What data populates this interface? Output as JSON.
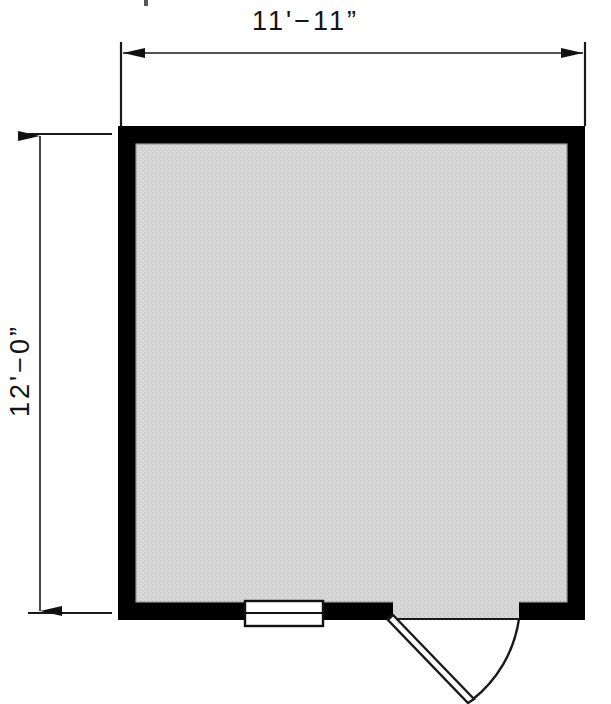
{
  "drawing": {
    "type": "architectural-floor-plan",
    "title": "Shed Floor Plan",
    "units": "feet-inches",
    "background_color": "#ffffff",
    "wall_color": "#000000",
    "floor_fill_color": "#d4d4d4",
    "line_color": "#1a1a1a"
  },
  "dimensions": {
    "top": {
      "label": "11'−11”",
      "orientation": "horizontal",
      "arrows": "both",
      "value_feet": 11,
      "value_inches": 11
    },
    "left": {
      "label": "12'−0”",
      "orientation": "vertical",
      "arrows": "both",
      "value_feet": 12,
      "value_inches": 0
    }
  },
  "building": {
    "outer": {
      "x": 118,
      "y": 126,
      "width": 467,
      "height": 494
    },
    "wall_thickness": 18,
    "interior": {
      "x": 136,
      "y": 144,
      "width": 431,
      "height": 458
    }
  },
  "openings": [
    {
      "name": "window",
      "type": "window",
      "wall": "south",
      "x": 245,
      "y": 602,
      "width": 77,
      "height": 22,
      "fill": "#ffffff",
      "has_center_mullion": true
    },
    {
      "name": "door",
      "type": "swing-door",
      "wall": "south",
      "opening_x": 393,
      "opening_width": 126,
      "hinge_side": "left",
      "swing_direction": "outward",
      "swing_angle_degrees": 60
    }
  ]
}
